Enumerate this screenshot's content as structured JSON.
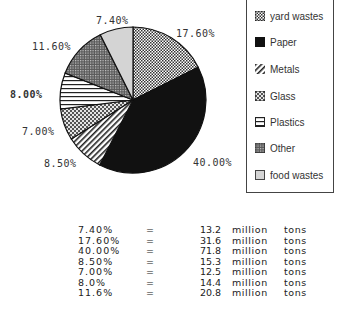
{
  "chart_data": {
    "type": "pie",
    "title": "",
    "start_angle": "12 o'clock",
    "direction": "clockwise",
    "slices": [
      {
        "label": "yard wastes",
        "percent": 17.6,
        "display": "17.60%",
        "million_tons": 31.6,
        "pattern": "fine-check",
        "fill": "#bdbdbd"
      },
      {
        "label": "Paper",
        "percent": 40.0,
        "display": "40.00%",
        "million_tons": 71.8,
        "pattern": "solid",
        "fill": "#111111"
      },
      {
        "label": "Metals",
        "percent": 8.5,
        "display": "8.50%",
        "million_tons": 15.3,
        "pattern": "diagonal-stripes",
        "fill": "#ffffff"
      },
      {
        "label": "Glass",
        "percent": 7.0,
        "display": "7.00%",
        "million_tons": 12.5,
        "pattern": "coarse-check",
        "fill": "#b5b5b5"
      },
      {
        "label": "Plastics",
        "percent": 8.0,
        "display": "8.00%",
        "million_tons": 14.4,
        "pattern": "horizontal-lines",
        "fill": "#ffffff"
      },
      {
        "label": "Other",
        "percent": 11.6,
        "display": "11.60%",
        "million_tons": 20.8,
        "pattern": "dense-dots",
        "fill": "#8f8f8f"
      },
      {
        "label": "food wastes",
        "percent": 7.4,
        "display": "7.40%",
        "million_tons": 13.2,
        "pattern": "light-gray",
        "fill": "#d4d4d4"
      }
    ],
    "legend_position": "right",
    "legend": [
      "yard wastes",
      "Paper",
      "Metals",
      "Glass",
      "Plastics",
      "Other",
      "food wastes"
    ]
  },
  "pie_labels": {
    "food": "7.40%",
    "yard": "17.60%",
    "other": "11.60%",
    "plastics": "8.00%",
    "glass": "7.00%",
    "metals": "8.50%",
    "paper": "40.00%"
  },
  "legend": {
    "items": [
      {
        "label": "yard wastes"
      },
      {
        "label": "Paper"
      },
      {
        "label": "Metals"
      },
      {
        "label": "Glass"
      },
      {
        "label": "Plastics"
      },
      {
        "label": "Other"
      },
      {
        "label": "food wastes"
      }
    ]
  },
  "table": {
    "rows": [
      {
        "pct": "7.40%",
        "eq": "=",
        "value": "13.2",
        "unit": "million",
        "tons": "tons"
      },
      {
        "pct": "17.60%",
        "eq": "=",
        "value": "31.6",
        "unit": "million",
        "tons": "tons"
      },
      {
        "pct": "40.00%",
        "eq": "=",
        "value": "71.8",
        "unit": "million",
        "tons": "tons"
      },
      {
        "pct": "8.50%",
        "eq": "=",
        "value": "15.3",
        "unit": "million",
        "tons": "tons"
      },
      {
        "pct": "7.00%",
        "eq": "=",
        "value": "12.5",
        "unit": "million",
        "tons": "tons"
      },
      {
        "pct": "8.0%",
        "eq": "=",
        "value": "14.4",
        "unit": "million",
        "tons": "tons"
      },
      {
        "pct": "11.6%",
        "eq": "=",
        "value": "20.8",
        "unit": "million",
        "tons": "tons"
      }
    ]
  }
}
